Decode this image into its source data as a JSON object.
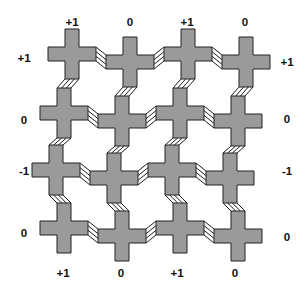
{
  "diagram": {
    "type": "lattice-of-crosses-with-sheared-bonds",
    "background": "#ffffff",
    "cross": {
      "fill": "#9a9a9a",
      "stroke": "#222222",
      "stroke_width": 1,
      "arm_half_width": 24,
      "arm_half_height": 25,
      "bar_half_thickness": 7
    },
    "ribbon": {
      "stroke": "#1c1c1c",
      "stroke_width": 1,
      "line_count": 4
    },
    "grid": {
      "cols_x": [
        64,
        122,
        180,
        238
      ],
      "rows_y": [
        62,
        121,
        178,
        236
      ],
      "col_displacement_pattern": [
        1,
        0,
        1,
        0
      ],
      "row_displacement_pattern": [
        1,
        0,
        -1,
        0
      ],
      "displacement_px": 8
    },
    "labels": {
      "color": "#111111",
      "font_size": 11.5,
      "top": {
        "texts": [
          "+1",
          "0",
          "+1",
          "0"
        ],
        "xs": [
          72,
          130,
          187,
          245
        ],
        "baseline_y": 26
      },
      "bottom": {
        "texts": [
          "+1",
          "0",
          "+1",
          "0"
        ],
        "xs": [
          63,
          121,
          177,
          235
        ],
        "baseline_y": 277
      },
      "left": {
        "texts": [
          "+1",
          "0",
          "-1",
          "0"
        ],
        "ys": [
          58,
          120,
          171,
          233
        ],
        "x": 24
      },
      "right": {
        "texts": [
          "+1",
          "0",
          "-1",
          "0"
        ],
        "ys": [
          62,
          119,
          171,
          237
        ],
        "x": 287
      }
    }
  }
}
